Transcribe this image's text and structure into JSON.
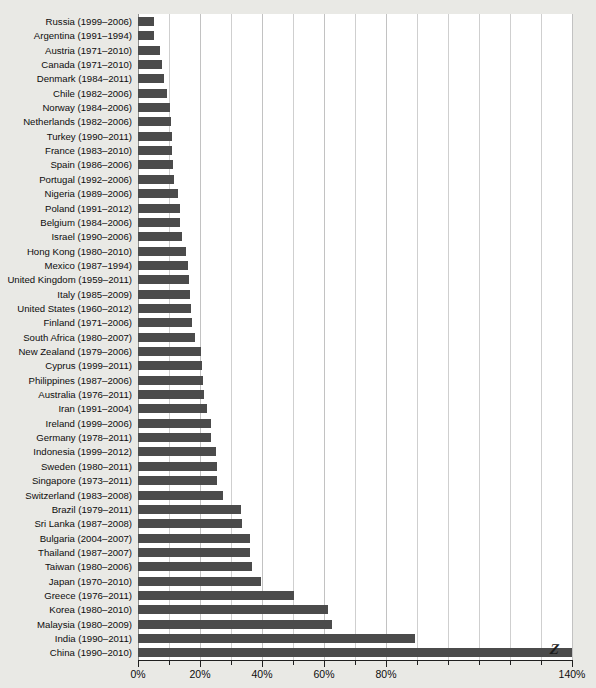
{
  "chart_data": {
    "type": "bar",
    "orientation": "horizontal",
    "title": "",
    "xlabel": "",
    "ylabel": "",
    "xlim": [
      0,
      140
    ],
    "xunit": "%",
    "grid": true,
    "legend": null,
    "bar_color": "#4b4b4b",
    "background_color": "#e9e9e5",
    "plot_background_color": "#ffffff",
    "x_ticks_major": [
      "0%",
      "20%",
      "40%",
      "60%",
      "80%",
      "140%"
    ],
    "x_tick_major_values": [
      0,
      20,
      40,
      60,
      80,
      140
    ],
    "x_tick_minor_values": [
      10,
      30,
      50,
      70,
      90,
      100,
      110,
      120,
      130
    ],
    "axis_break_note": "China bar truncated at axis end with Z break marker",
    "categories": [
      "Russia (1999–2006)",
      "Argentina (1991–1994)",
      "Austria (1971–2010)",
      "Canada (1971–2010)",
      "Denmark (1984–2011)",
      "Chile (1982–2006)",
      "Norway (1984–2006)",
      "Netherlands (1982–2006)",
      "Turkey (1990–2011)",
      "France (1983–2010)",
      "Spain (1986–2006)",
      "Portugal (1992–2006)",
      "Nigeria (1989–2006)",
      "Poland (1991–2012)",
      "Belgium (1984–2006)",
      "Israel (1990–2006)",
      "Hong Kong (1980–2010)",
      "Mexico (1987–1994)",
      "United Kingdom (1959–2011)",
      "Italy (1985–2009)",
      "United States (1960–2012)",
      "Finland (1971–2006)",
      "South Africa (1980–2007)",
      "New Zealand (1979–2006)",
      "Cyprus (1999–2011)",
      "Philippines (1987–2006)",
      "Australia (1976–2011)",
      "Iran (1991–2004)",
      "Ireland (1999–2006)",
      "Germany (1978–2011)",
      "Indonesia (1999–2012)",
      "Sweden (1980–2011)",
      "Singapore (1973–2011)",
      "Switzerland (1983–2008)",
      "Brazil (1979–2011)",
      "Sri Lanka (1987–2008)",
      "Bulgaria (2004–2007)",
      "Thailand (1987–2007)",
      "Taiwan (1980–2006)",
      "Japan (1970–2010)",
      "Greece (1976–2011)",
      "Korea (1980–2010)",
      "Malaysia (1980–2009)",
      "India (1990–2011)",
      "China (1990–2010)"
    ],
    "values": [
      5.2,
      5.0,
      7.2,
      7.6,
      8.4,
      9.4,
      10.2,
      10.8,
      11.0,
      11.0,
      11.4,
      11.7,
      12.8,
      13.4,
      13.7,
      14.1,
      15.6,
      16.2,
      16.5,
      16.7,
      17.0,
      17.3,
      18.4,
      20.4,
      20.8,
      21.0,
      21.4,
      22.2,
      23.4,
      23.6,
      25.2,
      25.4,
      25.6,
      27.5,
      33.2,
      33.4,
      36.0,
      36.2,
      36.8,
      39.8,
      50.4,
      61.4,
      62.5,
      89.5,
      140.0
    ],
    "truncated_index": 44
  }
}
